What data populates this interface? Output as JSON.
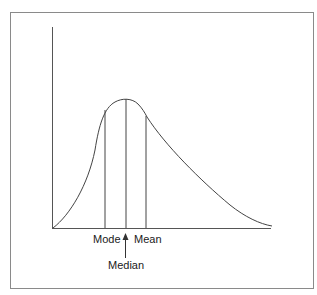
{
  "diagram": {
    "labels": {
      "mode": "Mode",
      "mean": "Mean",
      "median": "Median"
    },
    "colors": {
      "frame": "#8a8a8a",
      "axis": "#555555",
      "curve": "#444444",
      "text": "#1a1a1a"
    }
  }
}
